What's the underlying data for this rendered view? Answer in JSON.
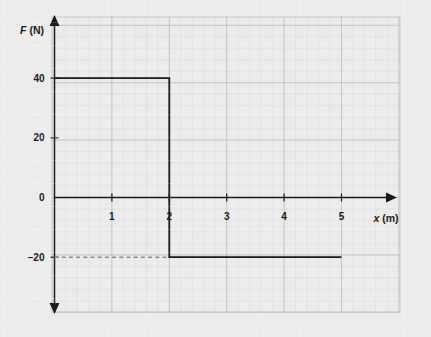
{
  "chart_data": {
    "type": "line",
    "title": "",
    "subtitle": "",
    "xlabel": "x (m)",
    "xlabel_italic_part": "x",
    "xlabel_rest": " (m)",
    "ylabel": "F (N)",
    "ylabel_italic_part": "F",
    "ylabel_rest": " (N)",
    "xlim": [
      0,
      6
    ],
    "ylim": [
      -40,
      50
    ],
    "x_ticks": [
      1,
      2,
      3,
      4,
      5
    ],
    "x_tick_labels": [
      "1",
      "2",
      "3",
      "4",
      "5"
    ],
    "y_ticks": [
      40,
      20,
      0,
      -20
    ],
    "y_tick_labels": [
      "40",
      "20",
      "0",
      "–20"
    ],
    "grid": true,
    "grid_major_step_x": 1,
    "grid_minor_per_major": 5,
    "legend": "none",
    "axis_arrows": [
      "x-positive",
      "y-positive",
      "y-negative"
    ],
    "series": [
      {
        "name": "Force vs position",
        "style": "solid",
        "points": [
          {
            "x": 0,
            "y": 40
          },
          {
            "x": 2,
            "y": 40
          },
          {
            "x": 2,
            "y": -20
          },
          {
            "x": 5,
            "y": -20
          }
        ]
      },
      {
        "name": "Guide line at F = -20 N",
        "style": "dashed",
        "points": [
          {
            "x": 0,
            "y": -20
          },
          {
            "x": 2,
            "y": -20
          }
        ]
      }
    ],
    "annotations": [],
    "colors": {
      "background": "#ececed",
      "grid_minor": "#dcdcdc",
      "grid_major": "#c6c6c6",
      "axis": "#1a1a1a",
      "curve": "#1a1a1a",
      "dashed_guide": "#7d7d7d"
    }
  },
  "figure": {
    "caption": "",
    "alt": "Step graph of force F in newtons versus position x in meters: F equals 40 N from x equals 0 to 2 m, then drops to negative 20 N from x equals 2 to 5 m."
  }
}
